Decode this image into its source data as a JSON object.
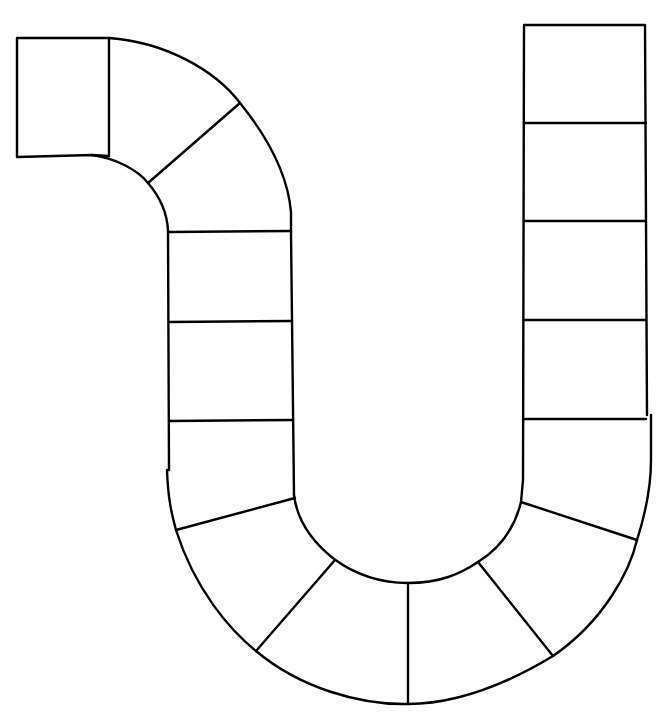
{
  "board": {
    "type": "blank board game path",
    "shape": "U-shaped track with hooked start",
    "background": "#ffffff",
    "line_color": "#000000",
    "space_count": 19,
    "spaces": [
      {
        "id": 1,
        "segment": "top-left start square"
      },
      {
        "id": 2,
        "segment": "upper curve"
      },
      {
        "id": 3,
        "segment": "upper curve"
      },
      {
        "id": 4,
        "segment": "left column"
      },
      {
        "id": 5,
        "segment": "left column"
      },
      {
        "id": 6,
        "segment": "left column"
      },
      {
        "id": 7,
        "segment": "bottom curve"
      },
      {
        "id": 8,
        "segment": "bottom curve"
      },
      {
        "id": 9,
        "segment": "bottom curve"
      },
      {
        "id": 10,
        "segment": "bottom curve"
      },
      {
        "id": 11,
        "segment": "bottom curve"
      },
      {
        "id": 12,
        "segment": "bottom curve"
      },
      {
        "id": 13,
        "segment": "right column"
      },
      {
        "id": 14,
        "segment": "right column"
      },
      {
        "id": 15,
        "segment": "right column"
      },
      {
        "id": 16,
        "segment": "right column"
      },
      {
        "id": 17,
        "segment": "right column top"
      }
    ]
  }
}
